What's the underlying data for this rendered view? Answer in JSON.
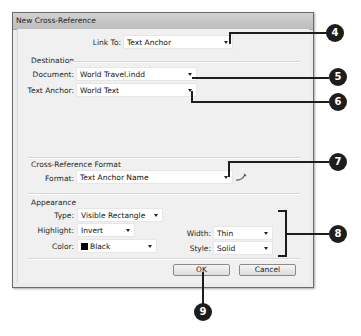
{
  "dialog": {
    "title": "New Cross-Reference",
    "link_to": {
      "label": "Link To:",
      "value": "Text Anchor"
    },
    "destination": {
      "group_label": "Destination",
      "document": {
        "label": "Document:",
        "value": "World Travel.indd"
      },
      "text_anchor": {
        "label": "Text Anchor:",
        "value": "World Text"
      }
    },
    "format_group": {
      "group_label": "Cross-Reference Format",
      "format": {
        "label": "Format:",
        "value": "Text Anchor Name"
      },
      "edit_icon": "pencil-icon"
    },
    "appearance": {
      "group_label": "Appearance",
      "type": {
        "label": "Type:",
        "value": "Visible Rectangle"
      },
      "highlight": {
        "label": "Highlight:",
        "value": "Invert"
      },
      "color": {
        "label": "Color:",
        "value": "Black",
        "swatch": "#000000"
      },
      "width": {
        "label": "Width:",
        "value": "Thin"
      },
      "style": {
        "label": "Style:",
        "value": "Solid"
      }
    },
    "buttons": {
      "ok": "OK",
      "cancel": "Cancel"
    }
  },
  "callouts": [
    "4",
    "5",
    "6",
    "7",
    "8",
    "9"
  ]
}
